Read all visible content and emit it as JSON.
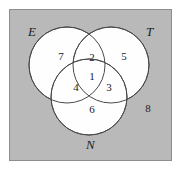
{
  "diagram": {
    "type": "venn-3-set",
    "background_color": "#b9b9b9",
    "border_color": "#8d8d8d",
    "circle_fill": "#fefefe",
    "circle_stroke": "#4a4a4a",
    "text_color": "#1b1b1b",
    "set_labels": [
      {
        "id": "E",
        "text": "E",
        "position": "top-left"
      },
      {
        "id": "T",
        "text": "T",
        "position": "top-right"
      },
      {
        "id": "N",
        "text": "N",
        "position": "bottom-center"
      }
    ],
    "regions": [
      {
        "id": "center-all",
        "label": "1",
        "sets": "E,T,N"
      },
      {
        "id": "e-and-t",
        "label": "2",
        "sets": "E,T"
      },
      {
        "id": "t-and-n",
        "label": "3",
        "sets": "T,N"
      },
      {
        "id": "e-and-n",
        "label": "4",
        "sets": "E,N"
      },
      {
        "id": "t-only",
        "label": "5",
        "sets": "T"
      },
      {
        "id": "n-only",
        "label": "6",
        "sets": "N"
      },
      {
        "id": "e-only",
        "label": "7",
        "sets": "E"
      },
      {
        "id": "outside",
        "label": "8",
        "sets": "none"
      }
    ]
  }
}
